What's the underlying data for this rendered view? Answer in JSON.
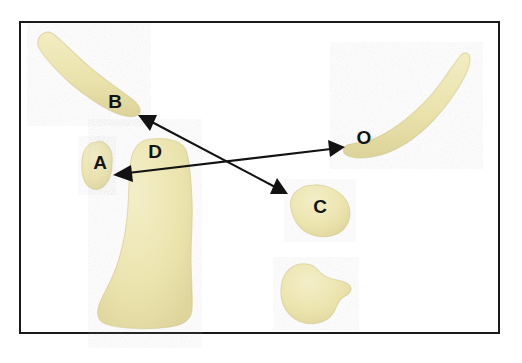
{
  "figure": {
    "background_color": "#ffffff",
    "frame": {
      "border_color": "#1a1a1a",
      "border_width_px": 2.5,
      "x": 19,
      "y": 21,
      "width": 481,
      "height": 313
    },
    "palette": {
      "blob_fill": "#ece4ae",
      "blob_fill_light": "#f2edc4",
      "blob_fill_dark": "#ddd49b",
      "blob_edge": "#cfc489",
      "arrow_color": "#121212",
      "label_color": "#141414"
    },
    "labels": [
      {
        "id": "label-b",
        "text": "B",
        "x": 115,
        "y": 103
      },
      {
        "id": "label-a",
        "text": "A",
        "x": 100,
        "y": 164
      },
      {
        "id": "label-d",
        "text": "D",
        "x": 155,
        "y": 153
      },
      {
        "id": "label-o",
        "text": "O",
        "x": 364,
        "y": 139
      },
      {
        "id": "label-c",
        "text": "C",
        "x": 320,
        "y": 208
      }
    ],
    "regions": [
      {
        "id": "region-b",
        "label": "B",
        "description": "upper-left elongated curved band"
      },
      {
        "id": "region-a",
        "label": "A",
        "description": "small kidney bean shaped blob at left"
      },
      {
        "id": "region-d",
        "label": "D",
        "description": "large boot shaped blob at center-left"
      },
      {
        "id": "region-o",
        "label": "O",
        "description": "right curved banana shaped band"
      },
      {
        "id": "region-c",
        "label": "C",
        "description": "rounded triangular blob at center-right"
      },
      {
        "id": "region-unlabeled",
        "label": "",
        "description": "unlabeled rounded notched blob at lower right"
      }
    ],
    "arrows": [
      {
        "id": "arrow-b-to-c",
        "from_label": "B",
        "to_label": "C",
        "double_headed": true,
        "x1": 138,
        "y1": 115,
        "x2": 288,
        "y2": 194
      },
      {
        "id": "arrow-a-to-o",
        "from_label": "A",
        "to_label": "O",
        "double_headed": true,
        "x1": 113,
        "y1": 175,
        "x2": 345,
        "y2": 147
      }
    ]
  }
}
